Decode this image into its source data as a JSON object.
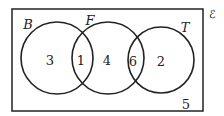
{
  "diagram": {
    "type": "venn",
    "universal_symbol": "ℰ",
    "sets": [
      {
        "name": "B",
        "cx": 57,
        "cy": 58,
        "r": 36
      },
      {
        "name": "F",
        "cx": 108,
        "cy": 58,
        "r": 36
      },
      {
        "name": "T",
        "cx": 161,
        "cy": 60,
        "r": 33
      }
    ],
    "regions": {
      "B_only": "3",
      "B_and_F": "1",
      "F_only": "4",
      "F_and_T": "6",
      "T_only": "2",
      "outside": "5"
    },
    "colors": {
      "stroke": "#222222",
      "background": "#ffffff"
    }
  }
}
